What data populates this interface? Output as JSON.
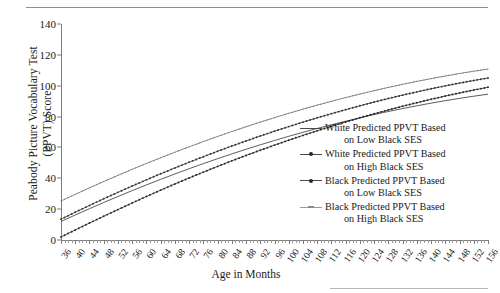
{
  "chart_data": {
    "type": "line",
    "title": "",
    "xlabel": "Age in Months",
    "ylabel": "Peabody Picture Vocabulary Test (PPVT) Score",
    "ylabel_line1": "Peabody Picture Vocabulary Test",
    "ylabel_line2": "(PPVT) Score",
    "xlim": [
      36,
      156
    ],
    "ylim": [
      0,
      140
    ],
    "ytick_values": [
      0,
      20,
      40,
      60,
      80,
      100,
      120,
      140
    ],
    "ytick_labels": [
      "0",
      "20",
      "40",
      "60",
      "80",
      "100",
      "120",
      "140"
    ],
    "xtick_values": [
      36,
      40,
      44,
      48,
      52,
      56,
      60,
      64,
      68,
      72,
      76,
      80,
      84,
      88,
      92,
      96,
      100,
      104,
      108,
      112,
      116,
      120,
      124,
      128,
      132,
      136,
      140,
      144,
      148,
      152,
      156
    ],
    "xtick_labels": [
      "36",
      "40",
      "44",
      "48",
      "52",
      "56",
      "60",
      "64",
      "68",
      "72",
      "76",
      "80",
      "84",
      "88",
      "92",
      "96",
      "100",
      "104",
      "108",
      "112",
      "116",
      "120",
      "124",
      "128",
      "132",
      "136",
      "140",
      "144",
      "148",
      "152",
      "156"
    ],
    "grid": false,
    "legend_position": "center-right",
    "x": [
      36,
      40,
      44,
      48,
      52,
      56,
      60,
      64,
      68,
      72,
      76,
      80,
      84,
      88,
      92,
      96,
      100,
      104,
      108,
      112,
      116,
      120,
      124,
      128,
      132,
      136,
      140,
      144,
      148,
      152,
      156
    ],
    "series": [
      {
        "name": "White Predicted PPVT Based on Low Black SES",
        "name_line1": "White Predicted PPVT Based",
        "name_line2": "on Low Black SES",
        "marker": "none",
        "color": "#4a4a4a",
        "values": [
          12.0,
          16.2,
          20.3,
          24.3,
          28.2,
          32.0,
          35.7,
          39.3,
          42.8,
          46.2,
          49.5,
          52.7,
          55.8,
          58.8,
          61.7,
          64.5,
          67.2,
          69.8,
          72.3,
          74.7,
          77.0,
          79.2,
          81.3,
          83.3,
          85.2,
          87.0,
          88.7,
          90.3,
          91.8,
          93.2,
          94.5
        ]
      },
      {
        "name": "White Predicted PPVT Based on High Black SES",
        "name_line1": "White Predicted PPVT Based",
        "name_line2": "on High Black SES",
        "marker": "dot",
        "color": "#333333",
        "values": [
          13.5,
          18.0,
          22.4,
          26.7,
          30.9,
          35.0,
          39.0,
          42.9,
          46.7,
          50.4,
          54.0,
          57.5,
          60.9,
          64.2,
          67.4,
          70.5,
          73.5,
          76.4,
          79.2,
          81.9,
          84.5,
          87.0,
          89.4,
          91.7,
          93.9,
          96.0,
          98.0,
          99.9,
          101.7,
          103.4,
          105.0
        ]
      },
      {
        "name": "Black Predicted PPVT Based on Low Black SES",
        "name_line1": "Black Predicted PPVT Based",
        "name_line2": "on Low Black SES",
        "marker": "dot",
        "color": "#262626",
        "values": [
          2.0,
          6.5,
          11.0,
          15.4,
          19.7,
          24.0,
          28.2,
          32.3,
          36.3,
          40.2,
          44.0,
          47.7,
          51.3,
          54.8,
          58.2,
          61.5,
          64.7,
          67.8,
          70.8,
          73.7,
          76.5,
          79.2,
          81.8,
          84.3,
          86.7,
          89.0,
          91.2,
          93.3,
          95.3,
          97.2,
          99.0
        ]
      },
      {
        "name": "Black Predicted PPVT Based on High Black SES",
        "name_line1": "Black Predicted PPVT Based",
        "name_line2": "on High Black SES",
        "marker": "dash",
        "color": "#6f6f6f",
        "values": [
          25.3,
          29.6,
          33.8,
          37.9,
          41.9,
          45.8,
          49.6,
          53.3,
          56.9,
          60.4,
          63.8,
          67.1,
          70.3,
          73.4,
          76.4,
          79.3,
          82.1,
          84.8,
          87.4,
          89.9,
          92.3,
          94.6,
          96.8,
          98.9,
          100.9,
          102.8,
          104.6,
          106.3,
          107.9,
          109.4,
          110.8
        ]
      }
    ]
  },
  "axis": {
    "ylabel_line1": "Peabody Picture Vocabulary Test",
    "ylabel_line2": "(PPVT) Score",
    "xlabel": "Age in Months"
  },
  "legend": {
    "entries": [
      {
        "line1": "White Predicted PPVT Based",
        "line2": "on Low Black SES"
      },
      {
        "line1": "White Predicted PPVT Based",
        "line2": "on High Black SES"
      },
      {
        "line1": "Black Predicted PPVT Based",
        "line2": "on Low Black SES"
      },
      {
        "line1": "Black Predicted PPVT Based",
        "line2": "on High Black SES"
      }
    ]
  }
}
